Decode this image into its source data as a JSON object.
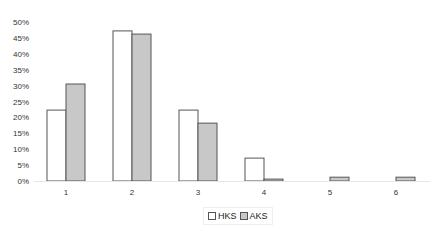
{
  "chart_data": {
    "type": "bar",
    "title": "",
    "xlabel": "",
    "ylabel": "",
    "categories": [
      "1",
      "2",
      "3",
      "4",
      "5",
      "6"
    ],
    "series": [
      {
        "name": "HKS",
        "values": [
          22.3,
          47.2,
          22.3,
          7.2,
          0,
          0
        ],
        "color": "#ffffff"
      },
      {
        "name": "AKS",
        "values": [
          30.5,
          46.2,
          18.2,
          0.6,
          1.2,
          1.2
        ],
        "color": "#c8c8c8"
      }
    ],
    "ylim": [
      0,
      50
    ],
    "yticks": [
      "0%",
      "5%",
      "10%",
      "15%",
      "20%",
      "25%",
      "30%",
      "35%",
      "40%",
      "45%",
      "50%"
    ],
    "grid": false,
    "legend_position": "bottom"
  },
  "legend": {
    "items": [
      {
        "label": "HKS"
      },
      {
        "label": "AKS"
      }
    ]
  }
}
